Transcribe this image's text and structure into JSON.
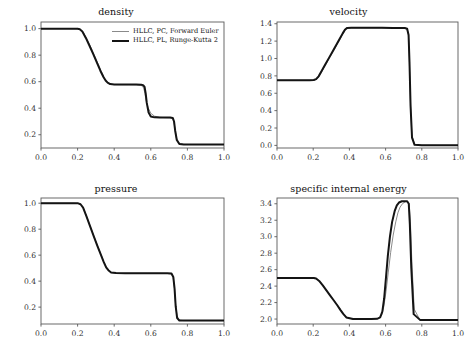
{
  "figure": {
    "layout": "2x2",
    "background": "#ffffff",
    "axis_color": "#5a5a5a",
    "tick_label_color": "#333333"
  },
  "legend": {
    "position": "upper-right-of-density-panel",
    "entries": [
      {
        "label": "HLLC, PC, Forward Euler",
        "color": "#8a8a8a",
        "linewidth": 1.1,
        "style": "thin"
      },
      {
        "label": "HLLC, PL, Runge-Kutta 2",
        "color": "#141414",
        "linewidth": 2.2,
        "style": "thick"
      }
    ]
  },
  "chart_data": [
    {
      "type": "line",
      "title": "density",
      "xlabel": "",
      "ylabel": "",
      "xlim": [
        0.0,
        1.0
      ],
      "ylim": [
        0.1,
        1.05
      ],
      "xticks": [
        0.0,
        0.2,
        0.4,
        0.6,
        0.8,
        1.0
      ],
      "xticklabels": [
        "0.0",
        "0.2",
        "0.4",
        "0.6",
        "0.8",
        "1.0"
      ],
      "yticks": [
        0.2,
        0.4,
        0.6,
        0.8,
        1.0
      ],
      "yticklabels": [
        "0.2",
        "0.4",
        "0.6",
        "0.8",
        "1.0"
      ],
      "grid": false,
      "legend": true,
      "series": [
        {
          "name": "HLLC, PC, Forward Euler",
          "color": "#8a8a8a",
          "x": [
            0.0,
            0.05,
            0.1,
            0.15,
            0.2,
            0.215,
            0.23,
            0.25,
            0.27,
            0.29,
            0.31,
            0.33,
            0.345,
            0.355,
            0.365,
            0.38,
            0.4,
            0.44,
            0.48,
            0.52,
            0.545,
            0.555,
            0.562,
            0.568,
            0.575,
            0.585,
            0.6,
            0.62,
            0.65,
            0.68,
            0.705,
            0.718,
            0.726,
            0.732,
            0.74,
            0.755,
            0.78,
            0.85,
            0.92,
            1.0
          ],
          "y": [
            1.0,
            1.0,
            1.0,
            1.0,
            0.999,
            0.993,
            0.975,
            0.925,
            0.866,
            0.804,
            0.74,
            0.676,
            0.63,
            0.607,
            0.592,
            0.581,
            0.578,
            0.577,
            0.577,
            0.576,
            0.573,
            0.566,
            0.548,
            0.51,
            0.455,
            0.404,
            0.362,
            0.34,
            0.331,
            0.329,
            0.328,
            0.324,
            0.3,
            0.245,
            0.175,
            0.136,
            0.127,
            0.126,
            0.126,
            0.126
          ]
        },
        {
          "name": "HLLC, PL, Runge-Kutta 2",
          "color": "#141414",
          "x": [
            0.0,
            0.05,
            0.1,
            0.15,
            0.2,
            0.212,
            0.226,
            0.245,
            0.265,
            0.285,
            0.305,
            0.325,
            0.342,
            0.353,
            0.364,
            0.378,
            0.4,
            0.44,
            0.48,
            0.52,
            0.548,
            0.558,
            0.566,
            0.572,
            0.578,
            0.588,
            0.6,
            0.62,
            0.65,
            0.68,
            0.706,
            0.72,
            0.727,
            0.733,
            0.742,
            0.756,
            0.78,
            0.85,
            0.92,
            1.0
          ],
          "y": [
            1.0,
            1.0,
            1.0,
            1.0,
            0.999,
            0.995,
            0.979,
            0.93,
            0.871,
            0.809,
            0.745,
            0.681,
            0.633,
            0.609,
            0.593,
            0.582,
            0.578,
            0.578,
            0.578,
            0.578,
            0.577,
            0.574,
            0.56,
            0.512,
            0.44,
            0.368,
            0.338,
            0.331,
            0.33,
            0.33,
            0.33,
            0.327,
            0.3,
            0.232,
            0.16,
            0.13,
            0.126,
            0.126,
            0.126,
            0.126
          ]
        }
      ]
    },
    {
      "type": "line",
      "title": "velocity",
      "xlabel": "",
      "ylabel": "",
      "xlim": [
        0.0,
        1.0
      ],
      "ylim": [
        -0.03,
        1.42
      ],
      "xticks": [
        0.0,
        0.2,
        0.4,
        0.6,
        0.8,
        1.0
      ],
      "xticklabels": [
        "0.0",
        "0.2",
        "0.4",
        "0.6",
        "0.8",
        "1.0"
      ],
      "yticks": [
        0.0,
        0.2,
        0.4,
        0.6,
        0.8,
        1.0,
        1.2,
        1.4
      ],
      "yticklabels": [
        "0.0",
        "0.2",
        "0.4",
        "0.6",
        "0.8",
        "1.0",
        "1.2",
        "1.4"
      ],
      "grid": false,
      "legend": false,
      "series": [
        {
          "name": "HLLC, PC, Forward Euler",
          "color": "#8a8a8a",
          "x": [
            0.0,
            0.06,
            0.12,
            0.18,
            0.205,
            0.218,
            0.232,
            0.25,
            0.27,
            0.29,
            0.31,
            0.33,
            0.35,
            0.365,
            0.378,
            0.39,
            0.41,
            0.46,
            0.52,
            0.58,
            0.64,
            0.68,
            0.705,
            0.718,
            0.726,
            0.731,
            0.737,
            0.745,
            0.76,
            0.8,
            0.88,
            1.0
          ],
          "y": [
            0.75,
            0.75,
            0.75,
            0.75,
            0.752,
            0.76,
            0.79,
            0.858,
            0.932,
            1.006,
            1.08,
            1.154,
            1.228,
            1.285,
            1.33,
            1.35,
            1.352,
            1.352,
            1.352,
            1.352,
            1.351,
            1.35,
            1.348,
            1.34,
            1.28,
            1.0,
            0.52,
            0.12,
            0.01,
            0.002,
            0.001,
            0.001
          ]
        },
        {
          "name": "HLLC, PL, Runge-Kutta 2",
          "color": "#141414",
          "x": [
            0.0,
            0.06,
            0.12,
            0.18,
            0.203,
            0.216,
            0.23,
            0.248,
            0.268,
            0.288,
            0.308,
            0.328,
            0.348,
            0.363,
            0.376,
            0.388,
            0.41,
            0.46,
            0.52,
            0.58,
            0.64,
            0.68,
            0.706,
            0.719,
            0.727,
            0.732,
            0.738,
            0.746,
            0.76,
            0.8,
            0.88,
            1.0
          ],
          "y": [
            0.75,
            0.75,
            0.75,
            0.75,
            0.752,
            0.762,
            0.795,
            0.862,
            0.936,
            1.01,
            1.084,
            1.158,
            1.232,
            1.289,
            1.334,
            1.352,
            1.353,
            1.353,
            1.353,
            1.353,
            1.352,
            1.352,
            1.35,
            1.342,
            1.27,
            0.96,
            0.45,
            0.09,
            0.006,
            0.001,
            0.001,
            0.001
          ]
        }
      ]
    },
    {
      "type": "line",
      "title": "pressure",
      "xlabel": "",
      "ylabel": "",
      "xlim": [
        0.0,
        1.0
      ],
      "ylim": [
        0.07,
        1.04
      ],
      "xticks": [
        0.0,
        0.2,
        0.4,
        0.6,
        0.8,
        1.0
      ],
      "xticklabels": [
        "0.0",
        "0.2",
        "0.4",
        "0.6",
        "0.8",
        "1.0"
      ],
      "yticks": [
        0.2,
        0.4,
        0.6,
        0.8,
        1.0
      ],
      "yticklabels": [
        "0.2",
        "0.4",
        "0.6",
        "0.8",
        "1.0"
      ],
      "grid": false,
      "legend": false,
      "series": [
        {
          "name": "HLLC, PC, Forward Euler",
          "color": "#8a8a8a",
          "x": [
            0.0,
            0.06,
            0.12,
            0.18,
            0.205,
            0.218,
            0.232,
            0.25,
            0.27,
            0.29,
            0.31,
            0.33,
            0.345,
            0.358,
            0.37,
            0.385,
            0.41,
            0.46,
            0.52,
            0.58,
            0.64,
            0.69,
            0.712,
            0.722,
            0.729,
            0.735,
            0.743,
            0.755,
            0.78,
            0.85,
            0.92,
            1.0
          ],
          "y": [
            1.0,
            1.0,
            1.0,
            1.0,
            0.998,
            0.99,
            0.962,
            0.895,
            0.818,
            0.742,
            0.668,
            0.597,
            0.545,
            0.505,
            0.483,
            0.466,
            0.461,
            0.46,
            0.46,
            0.46,
            0.46,
            0.459,
            0.455,
            0.43,
            0.35,
            0.23,
            0.135,
            0.1,
            0.096,
            0.096,
            0.096,
            0.096
          ]
        },
        {
          "name": "HLLC, PL, Runge-Kutta 2",
          "color": "#141414",
          "x": [
            0.0,
            0.06,
            0.12,
            0.18,
            0.203,
            0.216,
            0.23,
            0.248,
            0.268,
            0.288,
            0.308,
            0.328,
            0.343,
            0.356,
            0.368,
            0.383,
            0.41,
            0.46,
            0.52,
            0.58,
            0.64,
            0.69,
            0.713,
            0.723,
            0.73,
            0.736,
            0.744,
            0.756,
            0.78,
            0.85,
            0.92,
            1.0
          ],
          "y": [
            1.0,
            1.0,
            1.0,
            1.0,
            0.999,
            0.992,
            0.966,
            0.9,
            0.823,
            0.747,
            0.672,
            0.6,
            0.547,
            0.506,
            0.484,
            0.467,
            0.462,
            0.461,
            0.461,
            0.461,
            0.461,
            0.461,
            0.458,
            0.432,
            0.34,
            0.205,
            0.115,
            0.097,
            0.096,
            0.096,
            0.096,
            0.096
          ]
        }
      ]
    },
    {
      "type": "line",
      "title": "specific internal energy",
      "xlabel": "",
      "ylabel": "",
      "xlim": [
        0.0,
        1.0
      ],
      "ylim": [
        1.94,
        3.47
      ],
      "xticks": [
        0.0,
        0.2,
        0.4,
        0.6,
        0.8,
        1.0
      ],
      "xticklabels": [
        "0.0",
        "0.2",
        "0.4",
        "0.6",
        "0.8",
        "1.0"
      ],
      "yticks": [
        2.0,
        2.2,
        2.4,
        2.6,
        2.8,
        3.0,
        3.2,
        3.4
      ],
      "yticklabels": [
        "2.0",
        "2.2",
        "2.4",
        "2.6",
        "2.8",
        "3.0",
        "3.2",
        "3.4"
      ],
      "grid": false,
      "legend": false,
      "series": [
        {
          "name": "HLLC, PC, Forward Euler",
          "color": "#8a8a8a",
          "x": [
            0.0,
            0.06,
            0.12,
            0.18,
            0.205,
            0.218,
            0.235,
            0.255,
            0.275,
            0.295,
            0.315,
            0.335,
            0.352,
            0.368,
            0.385,
            0.42,
            0.47,
            0.52,
            0.548,
            0.565,
            0.578,
            0.59,
            0.602,
            0.615,
            0.628,
            0.642,
            0.656,
            0.668,
            0.68,
            0.695,
            0.71,
            0.722,
            0.73,
            0.737,
            0.745,
            0.758,
            0.79,
            0.87,
            1.0
          ],
          "y": [
            2.5,
            2.5,
            2.5,
            2.5,
            2.498,
            2.49,
            2.46,
            2.405,
            2.345,
            2.285,
            2.225,
            2.165,
            2.11,
            2.06,
            2.02,
            2.0,
            2.0,
            2.0,
            2.002,
            2.012,
            2.05,
            2.15,
            2.33,
            2.57,
            2.81,
            3.02,
            3.18,
            3.29,
            3.36,
            3.405,
            3.425,
            3.428,
            3.4,
            3.18,
            2.7,
            2.12,
            1.99,
            1.99,
            1.99
          ]
        },
        {
          "name": "HLLC, PL, Runge-Kutta 2",
          "color": "#141414",
          "x": [
            0.0,
            0.06,
            0.12,
            0.18,
            0.203,
            0.216,
            0.233,
            0.253,
            0.273,
            0.293,
            0.313,
            0.333,
            0.35,
            0.366,
            0.383,
            0.42,
            0.47,
            0.52,
            0.553,
            0.57,
            0.582,
            0.592,
            0.602,
            0.612,
            0.624,
            0.636,
            0.65,
            0.662,
            0.674,
            0.69,
            0.706,
            0.719,
            0.728,
            0.734,
            0.742,
            0.755,
            0.79,
            0.87,
            1.0
          ],
          "y": [
            2.5,
            2.5,
            2.5,
            2.5,
            2.499,
            2.492,
            2.463,
            2.408,
            2.348,
            2.288,
            2.228,
            2.168,
            2.112,
            2.062,
            2.02,
            2.0,
            2.0,
            2.0,
            2.003,
            2.02,
            2.09,
            2.25,
            2.5,
            2.76,
            3.0,
            3.18,
            3.31,
            3.38,
            3.415,
            3.43,
            3.432,
            3.43,
            3.4,
            3.15,
            2.62,
            2.06,
            1.99,
            1.99,
            1.99
          ]
        }
      ]
    }
  ]
}
